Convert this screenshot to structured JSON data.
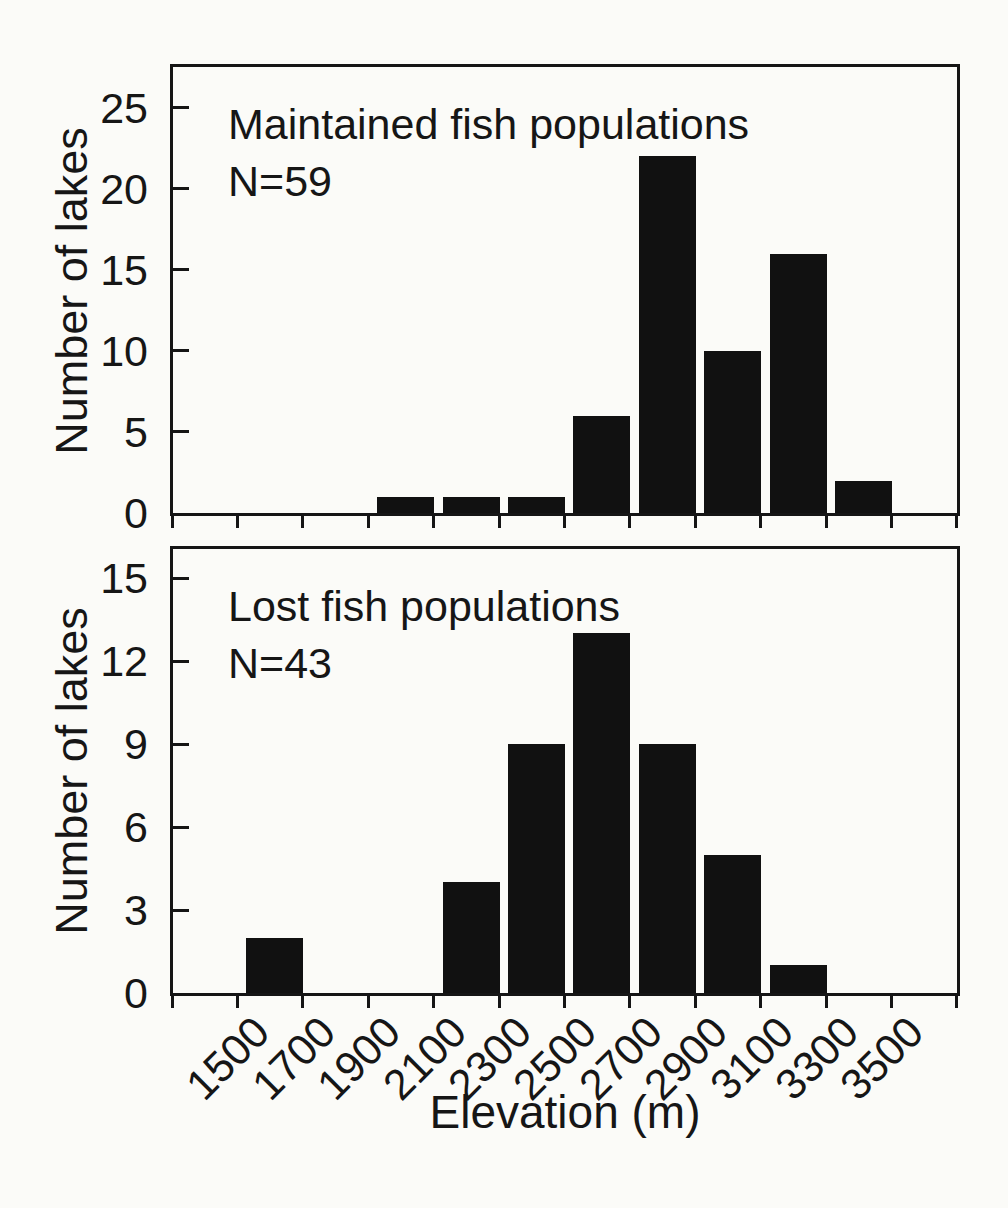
{
  "colors": {
    "bar": "#111111",
    "axis": "#151515",
    "text": "#161616",
    "background": "#fbfbf8"
  },
  "x_axis": {
    "title": "Elevation (m)",
    "tick_labels": [
      "1500",
      "1700",
      "1900",
      "2100",
      "2300",
      "2500",
      "2700",
      "2900",
      "3100",
      "3300",
      "3500"
    ]
  },
  "chart_data": [
    {
      "type": "bar",
      "title": "Maintained fish populations",
      "n_label": "N=59",
      "n_value": 59,
      "ylabel": "Number of lakes",
      "xlabel": "",
      "bin_edges": [
        1300,
        1500,
        1700,
        1900,
        2100,
        2300,
        2500,
        2700,
        2900,
        3100,
        3300,
        3500,
        3700
      ],
      "values": [
        0,
        0,
        0,
        1,
        1,
        1,
        6,
        22,
        10,
        16,
        2,
        0
      ],
      "yticks": [
        0,
        5,
        10,
        15,
        20,
        25
      ],
      "ylim": [
        0,
        27.5
      ],
      "x_tick_labels_shown": false,
      "grid": false,
      "legend": "none"
    },
    {
      "type": "bar",
      "title": "Lost fish populations",
      "n_label": "N=43",
      "n_value": 43,
      "ylabel": "Number of lakes",
      "xlabel": "Elevation (m)",
      "bin_edges": [
        1300,
        1500,
        1700,
        1900,
        2100,
        2300,
        2500,
        2700,
        2900,
        3100,
        3300,
        3500,
        3700
      ],
      "values": [
        0,
        2,
        0,
        0,
        4,
        9,
        13,
        9,
        5,
        1,
        0,
        0
      ],
      "yticks": [
        0,
        3,
        6,
        9,
        12,
        15
      ],
      "ylim": [
        0,
        16.05
      ],
      "x_tick_labels_shown": true,
      "grid": false,
      "legend": "none"
    }
  ]
}
